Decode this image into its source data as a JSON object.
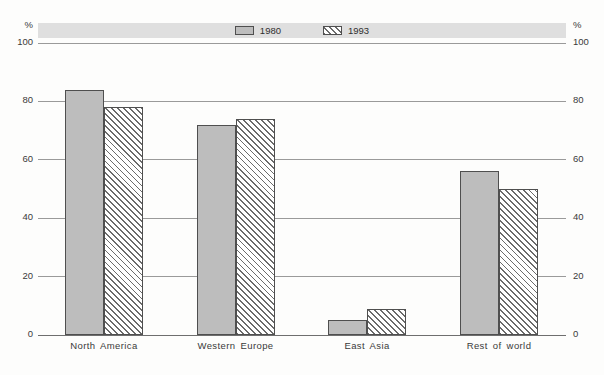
{
  "chart_data": {
    "type": "bar",
    "title": "",
    "categories": [
      "North America",
      "Western Europe",
      "East Asia",
      "Rest of world"
    ],
    "series": [
      {
        "name": "1980",
        "style": "solid",
        "values": [
          84,
          72,
          5,
          56
        ]
      },
      {
        "name": "1993",
        "style": "hatch",
        "values": [
          78,
          74,
          9,
          50
        ]
      }
    ],
    "ylabel_left": "%",
    "ylabel_right": "%",
    "yticks": [
      0,
      20,
      40,
      60,
      80,
      100
    ],
    "ylim": [
      0,
      100
    ],
    "grid": true,
    "legend_position": "top-band"
  },
  "colors": {
    "series_solid_fill": "#bdbdbd",
    "bar_border": "#4f4f4f",
    "hatch_line": "#6b6b6b",
    "legend_band_bg": "#dfdfdf",
    "gridline": "#9a9a9a",
    "axis_text": "#3a3a3a"
  }
}
